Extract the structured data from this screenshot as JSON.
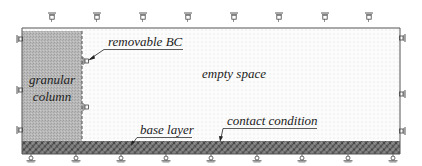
{
  "diagram": {
    "labels": {
      "removable_bc": "removable BC",
      "granular_line1": "granular",
      "granular_line2": "column",
      "empty_space": "empty space",
      "base_layer": "base layer",
      "contact_condition": "contact condition"
    },
    "regions": [
      {
        "name": "granular column",
        "fill": "#b5b5b5"
      },
      {
        "name": "empty space",
        "fill": "#fbfbfb"
      },
      {
        "name": "base layer",
        "fill": "#6e6e6e"
      }
    ],
    "supports": {
      "top_count": 8,
      "bottom_count": 9,
      "left_count": 3,
      "right_count": 3
    },
    "colors": {
      "frame": "#555555",
      "text": "#222222",
      "column": "#b5b5b5",
      "base": "#6e6e6e"
    }
  }
}
